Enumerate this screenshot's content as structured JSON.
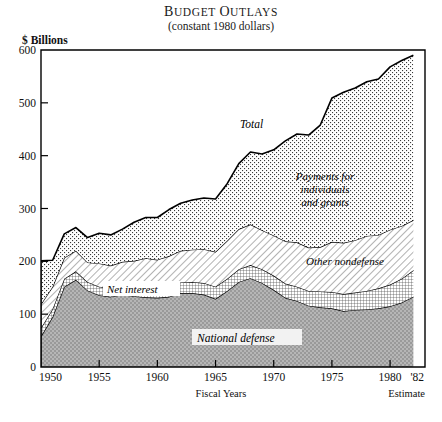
{
  "title_first_letters": [
    "B",
    "O"
  ],
  "subtitle": "(constant 1980 dollars)",
  "y_axis_label": "$ Billions",
  "x_axis_label": "Fiscal Years",
  "estimate_note": "Estimate",
  "estimate_tick": "'82",
  "colors": {
    "ink": "#111111",
    "national_defense_fill": "#a8a8a8",
    "net_interest_fill": "#ffffff",
    "other_nondefense_fill": "#ffffff",
    "payments_fill": "#ffffff",
    "plot_border": "#000000",
    "page_background": "#ffffff"
  },
  "series_labels": {
    "total": "Total",
    "payments": [
      "Payments for",
      "individuals",
      "and grants"
    ],
    "other_nondefense": "Other nondefense",
    "net_interest": "Net interest",
    "national_defense": "National defense"
  },
  "chart_data": {
    "type": "area",
    "subtitle": "(constant 1980 dollars)",
    "xlabel": "Fiscal Years",
    "ylabel": "$ Billions",
    "xlim": [
      1950,
      1983
    ],
    "ylim": [
      0,
      600
    ],
    "yticks": [
      0,
      100,
      200,
      300,
      400,
      500,
      600
    ],
    "xticks": [
      1950,
      1955,
      1960,
      1965,
      1970,
      1975,
      1980
    ],
    "xtick_labels": [
      "1950",
      "1955",
      "1960",
      "1965",
      "1970",
      "1975",
      "1980"
    ],
    "extra_xtick_label": "'82",
    "grid": false,
    "legend": "inline-labels",
    "stacked": true,
    "stack_order_bottom_to_top": [
      "National defense",
      "Net interest",
      "Other nondefense",
      "Payments for individuals and grants"
    ],
    "x": [
      1950,
      1951,
      1952,
      1953,
      1954,
      1955,
      1956,
      1957,
      1958,
      1959,
      1960,
      1961,
      1962,
      1963,
      1964,
      1965,
      1966,
      1967,
      1968,
      1969,
      1970,
      1971,
      1972,
      1973,
      1974,
      1975,
      1976,
      1977,
      1978,
      1979,
      1980,
      1981,
      1982
    ],
    "series": [
      {
        "name": "National defense",
        "pattern": "gray-stipple",
        "values": [
          58,
          95,
          152,
          165,
          145,
          136,
          133,
          137,
          134,
          132,
          131,
          133,
          140,
          140,
          137,
          129,
          144,
          161,
          168,
          159,
          146,
          131,
          125,
          116,
          113,
          111,
          106,
          108,
          109,
          111,
          115,
          122,
          133
        ]
      },
      {
        "name": "Net interest",
        "pattern": "fine-grid",
        "values": [
          16,
          15,
          15,
          16,
          16,
          16,
          16,
          17,
          17,
          19,
          19,
          19,
          20,
          21,
          22,
          23,
          23,
          24,
          25,
          26,
          27,
          27,
          27,
          28,
          30,
          31,
          32,
          33,
          35,
          38,
          41,
          45,
          50
        ]
      },
      {
        "name": "Other nondefense",
        "pattern": "diagonal-hatch",
        "values": [
          45,
          42,
          40,
          39,
          37,
          44,
          43,
          45,
          50,
          55,
          53,
          58,
          60,
          61,
          64,
          66,
          72,
          76,
          77,
          74,
          76,
          80,
          84,
          82,
          84,
          95,
          97,
          99,
          104,
          101,
          104,
          100,
          95
        ]
      },
      {
        "name": "Payments for individuals and grants",
        "pattern": "dot-stipple",
        "values": [
          82,
          50,
          45,
          44,
          47,
          57,
          58,
          62,
          73,
          77,
          80,
          88,
          90,
          94,
          97,
          100,
          108,
          124,
          137,
          144,
          162,
          190,
          205,
          213,
          231,
          272,
          285,
          288,
          292,
          295,
          308,
          313,
          312
        ]
      }
    ],
    "total_values": [
      201,
      202,
      252,
      264,
      245,
      253,
      250,
      261,
      274,
      283,
      283,
      298,
      310,
      316,
      320,
      318,
      347,
      385,
      407,
      403,
      411,
      428,
      441,
      439,
      458,
      509,
      520,
      528,
      540,
      545,
      568,
      580,
      590
    ]
  }
}
